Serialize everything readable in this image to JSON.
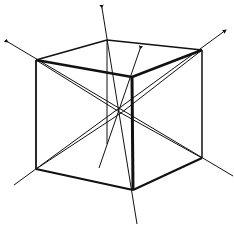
{
  "diagram": {
    "type": "cube-with-body-diagonals-and-axes",
    "colors": {
      "stroke": "#111111",
      "background": "#ffffff"
    },
    "vertices": {
      "front_top_left": [
        36,
        60
      ],
      "back_top_left": [
        107,
        40
      ],
      "back_top_right": [
        202,
        50
      ],
      "front_top_right": [
        132,
        77
      ],
      "front_bottom_left": [
        36,
        169
      ],
      "front_bottom_right": [
        133,
        190
      ],
      "back_bottom_right": [
        202,
        158
      ],
      "back_bottom_left": [
        107,
        144
      ]
    },
    "center": [
      121,
      113
    ],
    "arrows": [
      {
        "name": "axis-arrow-top-left",
        "tip": [
          8,
          42
        ]
      },
      {
        "name": "axis-arrow-top",
        "tip": [
          102,
          8
        ]
      },
      {
        "name": "axis-arrow-inner",
        "tip": [
          140,
          49
        ]
      },
      {
        "name": "axis-arrow-right",
        "tip": [
          226,
          30
        ]
      }
    ]
  }
}
